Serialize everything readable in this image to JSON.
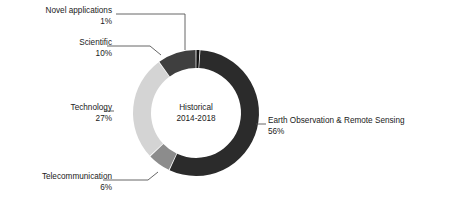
{
  "chart_data": {
    "type": "pie",
    "title": "",
    "center_label": {
      "line1": "Historical",
      "line2": "2014-2018"
    },
    "donut": {
      "cx": 196,
      "cy": 113,
      "outer_radius": 63,
      "inner_radius": 45,
      "start_angle_deg": 0,
      "direction": "clockwise",
      "gap_deg": 0.8
    },
    "categories": [
      "Novel applications",
      "Earth Observation & Remote Sensing",
      "Telecommunication",
      "Technology",
      "Scientific"
    ],
    "values": [
      1,
      56,
      6,
      27,
      10
    ],
    "value_suffix": "%",
    "colors": [
      "#111111",
      "#2b2b2b",
      "#8c8c8c",
      "#d4d4d4",
      "#3f3f3f"
    ],
    "legend_position": "callout-labels",
    "grid": false,
    "background": "#ffffff",
    "slices": [
      {
        "name": "Novel applications",
        "value": 1,
        "value_text": "1%",
        "color": "#111111",
        "label_align": "right",
        "leader": "elbow-down"
      },
      {
        "name": "Earth Observation & Remote Sensing",
        "value": 56,
        "value_text": "56%",
        "color": "#2b2b2b",
        "label_align": "left",
        "leader": "dash"
      },
      {
        "name": "Telecommunication",
        "value": 6,
        "value_text": "6%",
        "color": "#8c8c8c",
        "label_align": "right",
        "leader": "elbow-diagonal"
      },
      {
        "name": "Technology",
        "value": 27,
        "value_text": "27%",
        "color": "#d4d4d4",
        "label_align": "right",
        "leader": "dash"
      },
      {
        "name": "Scientific",
        "value": 10,
        "value_text": "10%",
        "color": "#3f3f3f",
        "label_align": "right",
        "leader": "diagonal"
      }
    ],
    "leader_color": "#555555"
  }
}
